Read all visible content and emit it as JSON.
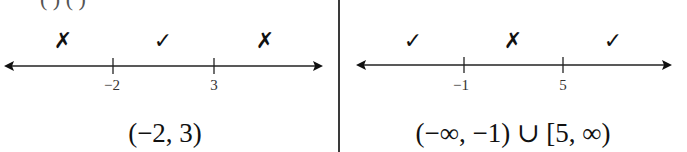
{
  "figure": {
    "colors": {
      "line": "#222222",
      "text": "#111111",
      "divider": "#3a3a3a"
    }
  },
  "left_panel": {
    "top_clipped_text": "( ) ( )",
    "tick_labels": [
      "−2",
      "3"
    ],
    "marks": [
      {
        "symbol": "✗",
        "type": "cross"
      },
      {
        "symbol": "✓",
        "type": "check"
      },
      {
        "symbol": "✗",
        "type": "cross"
      }
    ],
    "interval": "(−2, 3)"
  },
  "right_panel": {
    "tick_labels": [
      "−1",
      "5"
    ],
    "marks": [
      {
        "symbol": "✓",
        "type": "check"
      },
      {
        "symbol": "✗",
        "type": "cross"
      },
      {
        "symbol": "✓",
        "type": "check"
      }
    ],
    "interval": "(−∞, −1) ∪ [5, ∞)"
  }
}
